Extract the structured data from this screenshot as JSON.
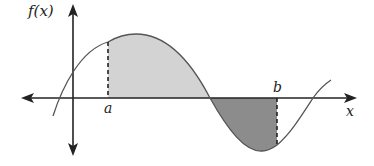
{
  "diagram": {
    "type": "function-graph-with-shaded-areas",
    "labels": {
      "y_axis": "f(x)",
      "x_axis": "x",
      "point_a": "a",
      "point_b": "b"
    },
    "colors": {
      "background": "#ffffff",
      "axis": "#222222",
      "curve": "#555555",
      "positive_area_fill": "#d3d3d3",
      "negative_area_fill": "#8c8c8c"
    },
    "regions": [
      {
        "name": "area-above-axis",
        "from": "a",
        "to": "first root after peak",
        "shade": "light gray"
      },
      {
        "name": "area-below-axis",
        "from": "root",
        "to": "b",
        "shade": "dark gray"
      }
    ]
  }
}
